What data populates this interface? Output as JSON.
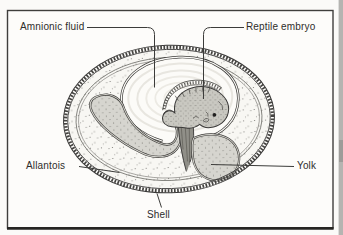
{
  "figure": {
    "type": "textbook-diagram",
    "labels": {
      "amnionic_fluid": "Amnionic fluid",
      "reptile_embryo": "Reptile embryo",
      "allantois": "Allantois",
      "yolk": "Yolk",
      "shell": "Shell"
    },
    "colors": {
      "paper": "#fdfcfa",
      "frame_line": "#3f3e3c",
      "ink": "#3a3938",
      "albumen": "#f8f7f3",
      "amnion_fill": "#fcfbf8",
      "fluid_ring": "#e8e6e0",
      "organ_gray": "#d6d5cf",
      "embryo_gray": "#c9c8c1",
      "stalk_shade": "#908f88",
      "page_edge": "#b5b4b1"
    }
  }
}
